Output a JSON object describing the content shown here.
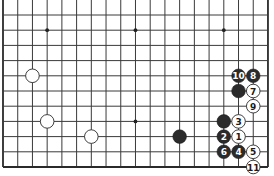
{
  "diagram": {
    "type": "go-board-diagram",
    "grid": {
      "columns": 19,
      "rows": 11,
      "origin_x": 3,
      "origin_y": 15,
      "col_spacing": 14.72,
      "row_spacing": 15.2,
      "top_extends_beyond": true,
      "left_edge": true,
      "right_edge": true,
      "bottom_edge": true
    },
    "colors": {
      "line": "#3a3a3a",
      "black_stone": "#2b2b2b",
      "white_stone": "#ffffff"
    },
    "stone_radius": 6.8,
    "star_points": [
      {
        "col": 3,
        "row": 1
      },
      {
        "col": 9,
        "row": 1
      },
      {
        "col": 15,
        "row": 1
      },
      {
        "col": 9,
        "row": 7
      }
    ],
    "stones": [
      {
        "color": "white",
        "col": 2,
        "row": 4,
        "label": ""
      },
      {
        "color": "white",
        "col": 3,
        "row": 7,
        "label": ""
      },
      {
        "color": "white",
        "col": 6,
        "row": 8,
        "label": ""
      },
      {
        "color": "black",
        "col": 12,
        "row": 8,
        "label": ""
      },
      {
        "color": "black",
        "col": 16,
        "row": 4,
        "label": "10"
      },
      {
        "color": "black",
        "col": 17,
        "row": 4,
        "label": "8"
      },
      {
        "color": "black",
        "col": 16,
        "row": 5,
        "label": ""
      },
      {
        "color": "white",
        "col": 17,
        "row": 5,
        "label": "7"
      },
      {
        "color": "white",
        "col": 17,
        "row": 6,
        "label": "9"
      },
      {
        "color": "black",
        "col": 15,
        "row": 7,
        "label": ""
      },
      {
        "color": "white",
        "col": 16,
        "row": 7,
        "label": "3"
      },
      {
        "color": "black",
        "col": 15,
        "row": 8,
        "label": "2"
      },
      {
        "color": "white",
        "col": 16,
        "row": 8,
        "label": "1"
      },
      {
        "color": "black",
        "col": 15,
        "row": 9,
        "label": "6"
      },
      {
        "color": "black",
        "col": 16,
        "row": 9,
        "label": "4"
      },
      {
        "color": "white",
        "col": 17,
        "row": 9,
        "label": "5"
      },
      {
        "color": "white",
        "col": 17,
        "row": 10,
        "label": "11"
      }
    ]
  }
}
